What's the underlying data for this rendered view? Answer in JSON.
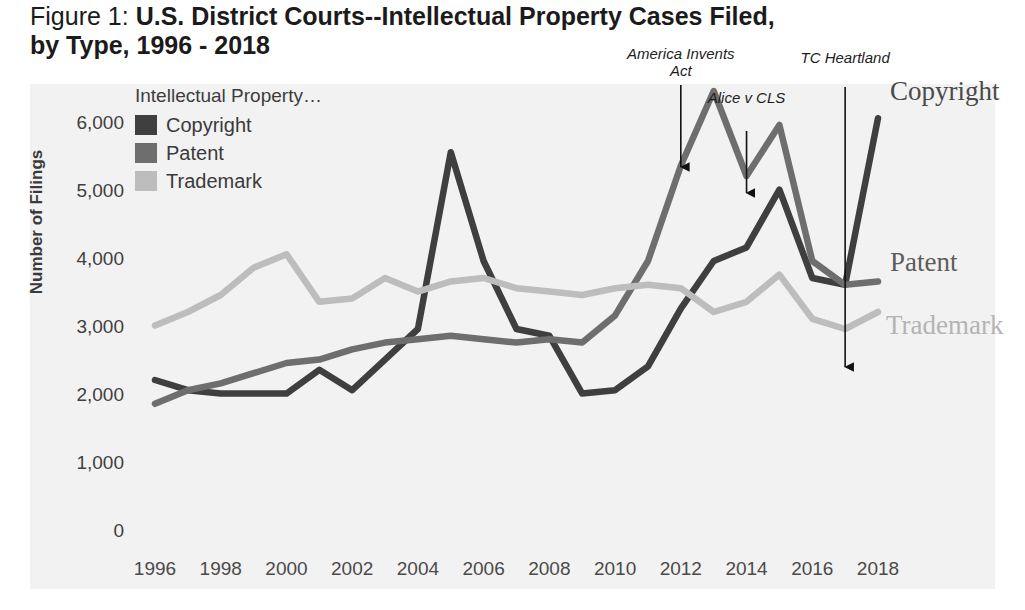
{
  "figure": {
    "label": "Figure 1:",
    "title_line1": "U.S. District Courts--Intellectual Property Cases Filed,",
    "title_line2": "by Type, 1996 - 2018"
  },
  "legend": {
    "title": "Intellectual Property…",
    "items": [
      {
        "label": "Copyright",
        "color": "#3f3f3f"
      },
      {
        "label": "Patent",
        "color": "#6e6e6e"
      },
      {
        "label": "Trademark",
        "color": "#bdbdbd"
      }
    ]
  },
  "series_end_labels": [
    {
      "name": "Copyright",
      "color": "#4a4a4a"
    },
    {
      "name": "Patent",
      "color": "#5d5d5d"
    },
    {
      "name": "Trademark",
      "color": "#b4b4b4"
    }
  ],
  "annotations": [
    {
      "text": "America Invents\nAct",
      "year": 2012
    },
    {
      "text": "Alice v CLS",
      "year": 2014
    },
    {
      "text": "TC Heartland",
      "year": 2017
    }
  ],
  "chart_data": {
    "type": "line",
    "title": "U.S. District Courts--Intellectual Property Cases Filed, by Type, 1996 - 2018",
    "xlabel": "",
    "ylabel": "Number of Filings",
    "xlim": [
      1996,
      2018
    ],
    "ylim": [
      0,
      6500
    ],
    "grid": false,
    "legend_position": "top-left",
    "x": [
      1996,
      1997,
      1998,
      1999,
      2000,
      2001,
      2002,
      2003,
      2004,
      2005,
      2006,
      2007,
      2008,
      2009,
      2010,
      2011,
      2012,
      2013,
      2014,
      2015,
      2016,
      2017,
      2018
    ],
    "xticks": [
      1996,
      1998,
      2000,
      2002,
      2004,
      2006,
      2008,
      2010,
      2012,
      2014,
      2016,
      2018
    ],
    "yticks": [
      0,
      1000,
      2000,
      3000,
      4000,
      5000,
      6000
    ],
    "ytick_labels": [
      "0",
      "1,000",
      "2,000",
      "3,000",
      "4,000",
      "5,000",
      "6,000"
    ],
    "series": [
      {
        "name": "Copyright",
        "color": "#3f3f3f",
        "values": [
          2250,
          2100,
          2050,
          2050,
          2050,
          2400,
          2100,
          2550,
          3000,
          5600,
          4000,
          3000,
          2900,
          2050,
          2100,
          2450,
          3300,
          4000,
          4200,
          5050,
          3750,
          3650,
          6100
        ]
      },
      {
        "name": "Patent",
        "color": "#6e6e6e",
        "values": [
          1900,
          2100,
          2200,
          2350,
          2500,
          2550,
          2700,
          2800,
          2850,
          2900,
          2850,
          2800,
          2850,
          2800,
          3200,
          4000,
          5400,
          6500,
          5250,
          6000,
          4000,
          3650,
          3700
        ]
      },
      {
        "name": "Trademark",
        "color": "#bdbdbd",
        "values": [
          3050,
          3250,
          3500,
          3900,
          4100,
          3400,
          3450,
          3750,
          3550,
          3700,
          3750,
          3600,
          3550,
          3500,
          3600,
          3650,
          3600,
          3250,
          3400,
          3800,
          3150,
          3000,
          3250
        ]
      }
    ]
  }
}
